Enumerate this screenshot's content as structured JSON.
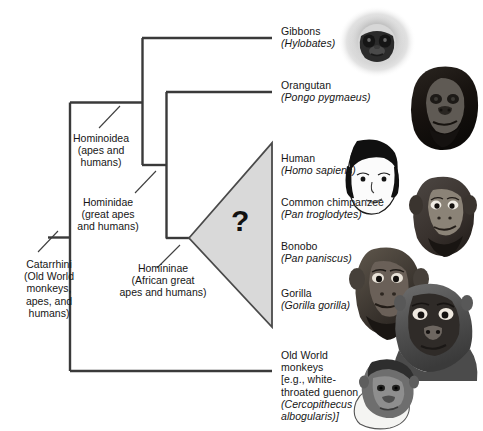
{
  "figure": {
    "line_color": "#3a3a3a",
    "triangle_fill": "#d9d9d9",
    "triangle_stroke": "#4a4a4a",
    "text_color": "#161616",
    "background": "#ffffff"
  },
  "uncertainty": {
    "symbol": "?",
    "meaning": "unresolved-polytomy"
  },
  "taxa": [
    {
      "id": "gibbons",
      "common": "Gibbons",
      "scientific": "(Hylobates)",
      "icon": "gibbon-face-icon"
    },
    {
      "id": "orangutan",
      "common": "Orangutan",
      "scientific": "(Pongo pygmaeus)",
      "icon": "orangutan-face-icon"
    },
    {
      "id": "human",
      "common": "Human",
      "scientific": "(Homo sapiens)",
      "icon": "human-face-icon"
    },
    {
      "id": "chimpanzee",
      "common": "Common chimpanzee",
      "scientific": "(Pan troglodytes)",
      "icon": "chimpanzee-face-icon"
    },
    {
      "id": "bonobo",
      "common": "Bonobo",
      "scientific": "(Pan paniscus)",
      "icon": "bonobo-face-icon"
    },
    {
      "id": "gorilla",
      "common": "Gorilla",
      "scientific": "(Gorilla gorilla)",
      "icon": "gorilla-face-icon"
    },
    {
      "id": "old-world-monkeys",
      "common_line1": "Old World",
      "common_line2": "monkeys",
      "common_line3": "[e.g., white-",
      "common_line4": "throated guenon",
      "scientific_line1": "(Cercopithecus",
      "scientific_line2": "albogularis)]",
      "icon": "guenon-face-icon"
    }
  ],
  "clades": [
    {
      "id": "catarrhini",
      "name": "Catarrhini",
      "description_line1": "(Old World",
      "description_line2": "monkeys,",
      "description_line3": "apes, and",
      "description_line4": "humans)"
    },
    {
      "id": "hominoidea",
      "name": "Hominoidea",
      "description_line1": "(apes and",
      "description_line2": "humans)"
    },
    {
      "id": "hominidae",
      "name": "Hominidae",
      "description_line1": "(great apes",
      "description_line2": "and humans)"
    },
    {
      "id": "homininae",
      "name": "Homininae",
      "description_line1": "(African great",
      "description_line2": "apes and humans)"
    }
  ]
}
